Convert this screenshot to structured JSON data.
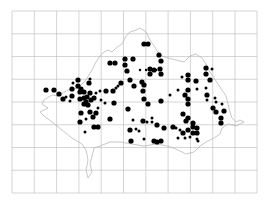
{
  "map": {
    "type": "distribution-dot-map",
    "background": "#ffffff",
    "grid_color": "#b8b8b8",
    "outline_color": "#b0b0b0",
    "dot_color": "#000000",
    "grid": {
      "x0": 12,
      "y0": 11,
      "x1": 257,
      "y1": 193,
      "verticals": [
        12,
        34.3,
        56.6,
        78.9,
        101.2,
        123.5,
        145.8,
        168.1,
        190.4,
        212.7,
        235,
        257
      ],
      "horizontals": [
        11,
        33.75,
        56.5,
        79.25,
        102,
        124.75,
        147.5,
        170.25,
        193
      ]
    },
    "outline_path": "M44,100 L52,95 L58,96 L68,90 L78,88 L86,80 L92,70 L96,62 L100,56 L104,52 L108,50 L112,52 L116,48 L122,44 L126,36 L130,32 L136,30 L140,28 L146,32 L150,40 L154,46 L158,52 L162,56 L168,58 L176,60 L184,62 L190,56 L196,54 L202,58 L206,64 L210,72 L214,78 L218,84 L222,90 L226,96 L228,104 L230,112 L232,118 L236,122 L240,120 L244,122 L236,126 L228,124 L222,128 L220,134 L214,138 L206,142 L200,146 L194,152 L186,154 L178,150 L168,146 L156,144 L144,146 L132,144 L120,142 L110,142 L100,146 L94,148 L92,156 L90,164 L92,172 L88,178 L86,170 L88,160 L86,150 L82,144 L72,138 L62,130 L52,122 L44,116 L40,112 L48,108 L42,104 Z",
    "dots": [
      {
        "x": 110,
        "y": 63,
        "r": 2.6
      },
      {
        "x": 115,
        "y": 63,
        "r": 2.6
      },
      {
        "x": 125,
        "y": 59,
        "r": 2.6
      },
      {
        "x": 125,
        "y": 65,
        "r": 2.6
      },
      {
        "x": 133,
        "y": 59,
        "r": 2.6
      },
      {
        "x": 127,
        "y": 71,
        "r": 2.6
      },
      {
        "x": 144,
        "y": 44,
        "r": 2.6
      },
      {
        "x": 148,
        "y": 44,
        "r": 2.6
      },
      {
        "x": 159,
        "y": 55,
        "r": 2.6
      },
      {
        "x": 161,
        "y": 61,
        "r": 2.6
      },
      {
        "x": 160,
        "y": 69,
        "r": 2.6
      },
      {
        "x": 154,
        "y": 70,
        "r": 2.6
      },
      {
        "x": 150,
        "y": 69,
        "r": 2.6
      },
      {
        "x": 150,
        "y": 74,
        "r": 2.6
      },
      {
        "x": 161,
        "y": 74,
        "r": 2.6
      },
      {
        "x": 156,
        "y": 70,
        "r": 1.2
      },
      {
        "x": 146,
        "y": 70,
        "r": 1.2
      },
      {
        "x": 140,
        "y": 70,
        "r": 1.2
      },
      {
        "x": 142,
        "y": 82,
        "r": 2.6
      },
      {
        "x": 130,
        "y": 80,
        "r": 2.6
      },
      {
        "x": 144,
        "y": 85,
        "r": 2.6
      },
      {
        "x": 143,
        "y": 91,
        "r": 2.6
      },
      {
        "x": 134,
        "y": 86,
        "r": 2.6
      },
      {
        "x": 121,
        "y": 83,
        "r": 2.6
      },
      {
        "x": 113,
        "y": 91,
        "r": 2.6
      },
      {
        "x": 118,
        "y": 86,
        "r": 1.5
      },
      {
        "x": 46,
        "y": 90,
        "r": 2.6
      },
      {
        "x": 54,
        "y": 90,
        "r": 2.6
      },
      {
        "x": 59,
        "y": 94,
        "r": 2.6
      },
      {
        "x": 63,
        "y": 99,
        "r": 2.6
      },
      {
        "x": 72,
        "y": 96,
        "r": 2.6
      },
      {
        "x": 72,
        "y": 89,
        "r": 2.6
      },
      {
        "x": 78,
        "y": 86,
        "r": 2.6
      },
      {
        "x": 81,
        "y": 89,
        "r": 2.6
      },
      {
        "x": 80,
        "y": 92,
        "r": 2.6
      },
      {
        "x": 84,
        "y": 92,
        "r": 2.6
      },
      {
        "x": 87,
        "y": 97,
        "r": 2.6
      },
      {
        "x": 84,
        "y": 98,
        "r": 2.6
      },
      {
        "x": 80,
        "y": 99,
        "r": 2.6
      },
      {
        "x": 86,
        "y": 102,
        "r": 2.6
      },
      {
        "x": 91,
        "y": 100,
        "r": 2.6
      },
      {
        "x": 94,
        "y": 98,
        "r": 2.6
      },
      {
        "x": 90,
        "y": 93,
        "r": 2.6
      },
      {
        "x": 89,
        "y": 83,
        "r": 2.6
      },
      {
        "x": 90,
        "y": 79,
        "r": 1.5
      },
      {
        "x": 78,
        "y": 80,
        "r": 2.6
      },
      {
        "x": 73,
        "y": 83,
        "r": 1.5
      },
      {
        "x": 96,
        "y": 93,
        "r": 1.5
      },
      {
        "x": 100,
        "y": 91,
        "r": 1.5
      },
      {
        "x": 106,
        "y": 91,
        "r": 2.6
      },
      {
        "x": 116,
        "y": 88,
        "r": 1.5
      },
      {
        "x": 114,
        "y": 103,
        "r": 2.6
      },
      {
        "x": 84,
        "y": 104,
        "r": 2.6
      },
      {
        "x": 88,
        "y": 105,
        "r": 2.6
      },
      {
        "x": 81,
        "y": 113,
        "r": 2.6
      },
      {
        "x": 90,
        "y": 112,
        "r": 2.6
      },
      {
        "x": 96,
        "y": 113,
        "r": 2.6
      },
      {
        "x": 98,
        "y": 108,
        "r": 1.5
      },
      {
        "x": 80,
        "y": 122,
        "r": 2.6
      },
      {
        "x": 86,
        "y": 119,
        "r": 1.5
      },
      {
        "x": 94,
        "y": 127,
        "r": 2.6
      },
      {
        "x": 98,
        "y": 127,
        "r": 2.6
      },
      {
        "x": 85,
        "y": 132,
        "r": 1.5
      },
      {
        "x": 66,
        "y": 97,
        "r": 1.5
      },
      {
        "x": 70,
        "y": 101,
        "r": 1.5
      },
      {
        "x": 93,
        "y": 117,
        "r": 2.6
      },
      {
        "x": 101,
        "y": 100,
        "r": 1.5
      },
      {
        "x": 105,
        "y": 103,
        "r": 1.5
      },
      {
        "x": 188,
        "y": 75,
        "r": 2.6
      },
      {
        "x": 188,
        "y": 80,
        "r": 2.6
      },
      {
        "x": 196,
        "y": 81,
        "r": 2.6
      },
      {
        "x": 206,
        "y": 68,
        "r": 2.6
      },
      {
        "x": 206,
        "y": 74,
        "r": 2.6
      },
      {
        "x": 212,
        "y": 69,
        "r": 1.5
      },
      {
        "x": 210,
        "y": 80,
        "r": 2.6
      },
      {
        "x": 182,
        "y": 77,
        "r": 1.5
      },
      {
        "x": 197,
        "y": 89,
        "r": 1.5
      },
      {
        "x": 188,
        "y": 90,
        "r": 2.6
      },
      {
        "x": 185,
        "y": 95,
        "r": 2.6
      },
      {
        "x": 188,
        "y": 99,
        "r": 2.6
      },
      {
        "x": 188,
        "y": 104,
        "r": 2.6
      },
      {
        "x": 178,
        "y": 90,
        "r": 1.5
      },
      {
        "x": 170,
        "y": 95,
        "r": 1.5
      },
      {
        "x": 161,
        "y": 101,
        "r": 2.6
      },
      {
        "x": 206,
        "y": 88,
        "r": 1.5
      },
      {
        "x": 207,
        "y": 95,
        "r": 2.6
      },
      {
        "x": 207,
        "y": 100,
        "r": 1.5
      },
      {
        "x": 216,
        "y": 102,
        "r": 1.5
      },
      {
        "x": 213,
        "y": 108,
        "r": 2.6
      },
      {
        "x": 216,
        "y": 112,
        "r": 2.6
      },
      {
        "x": 224,
        "y": 111,
        "r": 2.6
      },
      {
        "x": 221,
        "y": 118,
        "r": 2.6
      },
      {
        "x": 221,
        "y": 123,
        "r": 2.6
      },
      {
        "x": 222,
        "y": 104,
        "r": 1.5
      },
      {
        "x": 215,
        "y": 98,
        "r": 1.5
      },
      {
        "x": 183,
        "y": 114,
        "r": 2.6
      },
      {
        "x": 188,
        "y": 118,
        "r": 2.6
      },
      {
        "x": 186,
        "y": 121,
        "r": 2.6
      },
      {
        "x": 193,
        "y": 123,
        "r": 2.6
      },
      {
        "x": 193,
        "y": 127,
        "r": 2.6
      },
      {
        "x": 197,
        "y": 128,
        "r": 2.6
      },
      {
        "x": 197,
        "y": 133,
        "r": 2.6
      },
      {
        "x": 193,
        "y": 133,
        "r": 2.6
      },
      {
        "x": 188,
        "y": 130,
        "r": 2.6
      },
      {
        "x": 183,
        "y": 133,
        "r": 2.6
      },
      {
        "x": 180,
        "y": 130,
        "r": 1.5
      },
      {
        "x": 185,
        "y": 138,
        "r": 1.5
      },
      {
        "x": 190,
        "y": 137,
        "r": 1.5
      },
      {
        "x": 197,
        "y": 139,
        "r": 1.5
      },
      {
        "x": 176,
        "y": 128,
        "r": 1.5
      },
      {
        "x": 173,
        "y": 127,
        "r": 2.6
      },
      {
        "x": 164,
        "y": 128,
        "r": 2.6
      },
      {
        "x": 157,
        "y": 125,
        "r": 2.6
      },
      {
        "x": 152,
        "y": 122,
        "r": 1.5
      },
      {
        "x": 147,
        "y": 122,
        "r": 1.5
      },
      {
        "x": 143,
        "y": 121,
        "r": 2.6
      },
      {
        "x": 133,
        "y": 120,
        "r": 1.5
      },
      {
        "x": 154,
        "y": 141,
        "r": 2.6
      },
      {
        "x": 157,
        "y": 142,
        "r": 2.6
      },
      {
        "x": 161,
        "y": 141,
        "r": 2.6
      },
      {
        "x": 144,
        "y": 139,
        "r": 1.5
      },
      {
        "x": 131,
        "y": 141,
        "r": 2.6
      },
      {
        "x": 139,
        "y": 131,
        "r": 1.5
      },
      {
        "x": 136,
        "y": 129,
        "r": 1.5
      },
      {
        "x": 130,
        "y": 130,
        "r": 2.6
      },
      {
        "x": 128,
        "y": 109,
        "r": 2.6
      },
      {
        "x": 148,
        "y": 104,
        "r": 2.6
      },
      {
        "x": 144,
        "y": 99,
        "r": 2.6
      },
      {
        "x": 152,
        "y": 118,
        "r": 1.5
      },
      {
        "x": 178,
        "y": 138,
        "r": 1.5
      },
      {
        "x": 198,
        "y": 141,
        "r": 1.5
      },
      {
        "x": 110,
        "y": 119,
        "r": 2.6
      }
    ]
  }
}
